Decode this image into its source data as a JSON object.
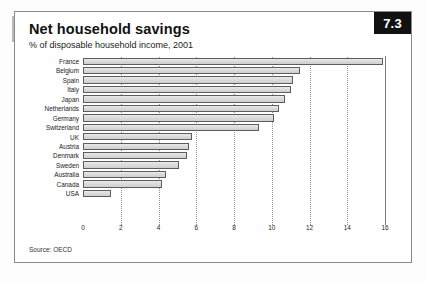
{
  "figure": {
    "number": "7.3",
    "title": "Net household savings",
    "subtitle": "% of disposable household income, 2001",
    "source": "Source: OECD"
  },
  "chart_data": {
    "type": "bar",
    "orientation": "horizontal",
    "title": "Net household savings",
    "subtitle": "% of disposable household income, 2001",
    "xlabel": "",
    "ylabel": "",
    "xlim": [
      0,
      16
    ],
    "xticks": [
      0,
      2,
      4,
      6,
      8,
      10,
      12,
      14,
      16
    ],
    "grid": "vertical-dotted",
    "legend": "none",
    "source": "Source: OECD",
    "categories": [
      "France",
      "Belgium",
      "Spain",
      "Italy",
      "Japan",
      "Netherlands",
      "Germany",
      "Switzerland",
      "UK",
      "Austria",
      "Denmark",
      "Sweden",
      "Australia",
      "Canada",
      "USA"
    ],
    "values": [
      15.9,
      11.5,
      11.1,
      11.0,
      10.7,
      10.4,
      10.1,
      9.3,
      5.8,
      5.6,
      5.5,
      5.1,
      4.4,
      4.2,
      1.5
    ],
    "series": [
      {
        "name": "Net household savings",
        "values": [
          15.9,
          11.5,
          11.1,
          11.0,
          10.7,
          10.4,
          10.1,
          9.3,
          5.8,
          5.6,
          5.5,
          5.1,
          4.4,
          4.2,
          1.5
        ]
      }
    ],
    "colors": {
      "bar_fill": "#dcdcdc",
      "bar_stroke": "#5d5d5d",
      "grid": "#8d8d8d",
      "badge_bg": "#111111",
      "badge_text": "#ffffff"
    }
  }
}
